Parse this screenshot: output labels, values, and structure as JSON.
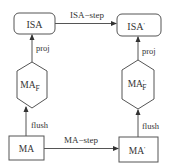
{
  "diagram": {
    "nodes": {
      "isa": {
        "label": "ISA",
        "shape": "rounded-rect"
      },
      "isa_prime": {
        "label": "ISA",
        "prime": "'",
        "shape": "rounded-rect"
      },
      "ma_f": {
        "label": "MA",
        "sub": "F",
        "prime": "",
        "shape": "hexagon"
      },
      "ma_f_prime": {
        "label": "MA",
        "sub": "F",
        "prime": "'",
        "shape": "hexagon"
      },
      "ma": {
        "label": "MA",
        "shape": "rect"
      },
      "ma_prime": {
        "label": "MA",
        "prime": "'",
        "shape": "rect"
      }
    },
    "edges": {
      "isa_step": {
        "label": "ISA−step",
        "from": "isa",
        "to": "isa_prime"
      },
      "ma_step": {
        "label": "MA−step",
        "from": "ma",
        "to": "ma_prime"
      },
      "proj_left": {
        "label": "proj",
        "from": "ma_f",
        "to": "isa"
      },
      "proj_right": {
        "label": "proj",
        "from": "ma_f_prime",
        "to": "isa_prime"
      },
      "flush_left": {
        "label": "flush",
        "from": "ma",
        "to": "ma_f"
      },
      "flush_right": {
        "label": "flush",
        "from": "ma_prime",
        "to": "ma_f_prime"
      }
    },
    "colors": {
      "stroke": "#555555",
      "text": "#333333",
      "background": "#ffffff"
    }
  }
}
